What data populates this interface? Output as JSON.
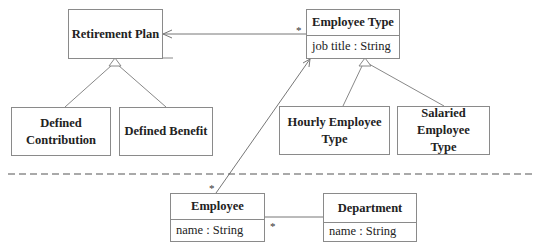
{
  "diagram": {
    "type": "UML class diagram",
    "classes": {
      "retirement_plan": {
        "name": "Retirement Plan"
      },
      "defined_contribution": {
        "name": "Defined Contribution"
      },
      "defined_benefit": {
        "name": "Defined Benefit"
      },
      "employee_type": {
        "name": "Employee Type",
        "attribute": "job title : String"
      },
      "hourly_employee_type": {
        "name": "Hourly Employee Type"
      },
      "salaried_employee_type": {
        "name": "Salaried Employee Type"
      },
      "employee": {
        "name": "Employee",
        "attribute": "name : String"
      },
      "department": {
        "name": "Department",
        "attribute": "name : String"
      }
    },
    "relationships": [
      {
        "kind": "association",
        "from": "Employee Type",
        "to": "Retirement Plan",
        "navigable_to": "Retirement Plan",
        "multiplicity_from": "*"
      },
      {
        "kind": "generalization",
        "child": "Defined Contribution",
        "parent": "Retirement Plan"
      },
      {
        "kind": "generalization",
        "child": "Defined Benefit",
        "parent": "Retirement Plan"
      },
      {
        "kind": "generalization",
        "child": "Hourly Employee Type",
        "parent": "Employee Type"
      },
      {
        "kind": "generalization",
        "child": "Salaried Employee Type",
        "parent": "Employee Type"
      },
      {
        "kind": "association",
        "from": "Employee",
        "to": "Employee Type",
        "navigable_to": "Employee Type",
        "multiplicity_from": "*"
      },
      {
        "kind": "association",
        "from": "Employee",
        "to": "Department",
        "multiplicity_from": "*"
      }
    ],
    "multiplicities": {
      "employee_type_to_retirement": "*",
      "employee_to_employee_type": "*",
      "employee_to_department": "*"
    },
    "separator": "dashed"
  }
}
